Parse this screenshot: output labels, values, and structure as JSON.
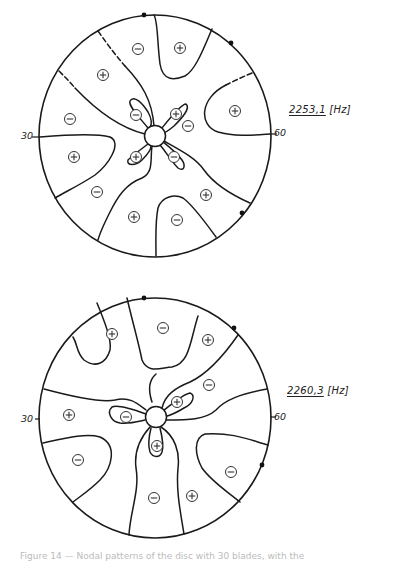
{
  "figures": [
    {
      "id": "top",
      "frequency_value": "2253,1",
      "frequency_unit": "[Hz]",
      "axis_left_label": "30",
      "axis_right_label": "60",
      "center": [
        155,
        136
      ],
      "radius": [
        116,
        121
      ],
      "hub_radius": 10,
      "boundary_dots": [
        [
          144,
          15
        ],
        [
          231,
          43
        ],
        [
          242,
          213
        ]
      ],
      "signs": [
        {
          "sign": "-",
          "x": 138,
          "y": 49
        },
        {
          "sign": "+",
          "x": 180,
          "y": 48
        },
        {
          "sign": "+",
          "x": 103,
          "y": 75
        },
        {
          "sign": "-",
          "x": 70,
          "y": 119
        },
        {
          "sign": "+",
          "x": 235,
          "y": 111
        },
        {
          "sign": "-",
          "x": 136,
          "y": 115
        },
        {
          "sign": "+",
          "x": 176,
          "y": 114
        },
        {
          "sign": "-",
          "x": 188,
          "y": 126
        },
        {
          "sign": "+",
          "x": 74,
          "y": 157
        },
        {
          "sign": "+",
          "x": 136,
          "y": 157
        },
        {
          "sign": "-",
          "x": 174,
          "y": 157
        },
        {
          "sign": "-",
          "x": 97,
          "y": 192
        },
        {
          "sign": "+",
          "x": 206,
          "y": 195
        },
        {
          "sign": "+",
          "x": 134,
          "y": 217
        },
        {
          "sign": "-",
          "x": 177,
          "y": 220
        }
      ]
    },
    {
      "id": "bottom",
      "frequency_value": "2260,3",
      "frequency_unit": "[Hz]",
      "axis_left_label": "30",
      "axis_right_label": "60",
      "center": [
        155,
        418
      ],
      "radius": [
        116,
        120
      ],
      "hub_radius": 10,
      "boundary_dots": [
        [
          144,
          298
        ],
        [
          234,
          328
        ],
        [
          262,
          465
        ]
      ],
      "signs": [
        {
          "sign": "+",
          "x": 112,
          "y": 334
        },
        {
          "sign": "-",
          "x": 163,
          "y": 328
        },
        {
          "sign": "+",
          "x": 208,
          "y": 340
        },
        {
          "sign": "-",
          "x": 209,
          "y": 385
        },
        {
          "sign": "+",
          "x": 69,
          "y": 415
        },
        {
          "sign": "-",
          "x": 126,
          "y": 417
        },
        {
          "sign": "+",
          "x": 177,
          "y": 402
        },
        {
          "sign": "+",
          "x": 157,
          "y": 446
        },
        {
          "sign": "-",
          "x": 78,
          "y": 460
        },
        {
          "sign": "-",
          "x": 231,
          "y": 472
        },
        {
          "sign": "-",
          "x": 154,
          "y": 498
        },
        {
          "sign": "+",
          "x": 192,
          "y": 496
        }
      ]
    }
  ],
  "caption": "Figure 14 — Nodal patterns of the disc with 30 blades, with the"
}
